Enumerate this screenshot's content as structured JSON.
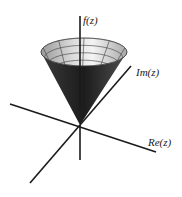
{
  "diagram": {
    "surface": "cone",
    "axes": {
      "vertical_label": "f(z)",
      "imaginary_label": "Im(z)",
      "real_label": "Re(z)"
    },
    "grid": {
      "rings": 9,
      "meridians": 5
    },
    "colors": {
      "axis": "#1a1a1a",
      "surface_dark": "#222222",
      "surface_light": "#f2f2f2",
      "grid_line": "#3a3a3a",
      "background": "#ffffff"
    }
  }
}
